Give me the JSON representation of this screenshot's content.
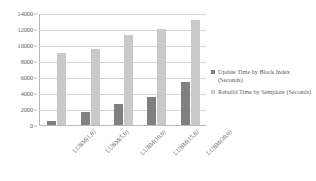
{
  "chart_data": {
    "type": "bar",
    "title": "",
    "xlabel": "",
    "ylabel": "",
    "ylim": [
      0,
      14000
    ],
    "grid": true,
    "legend_position": "right",
    "categories": [
      "LUBM(1,0)",
      "LUBM(5,0)",
      "LUBM(10,0)",
      "LUBM(15,0)",
      "LUBM(20,0)"
    ],
    "y_ticks": [
      14000,
      12000,
      10000,
      8000,
      6000,
      4000,
      2000,
      0
    ],
    "series": [
      {
        "name": "Update Time by Block Index (Seconds)",
        "color": "#808080",
        "values": [
          500,
          1600,
          2600,
          3450,
          5400
        ]
      },
      {
        "name": "Rebuild Time by Semplore (Seconds)",
        "color": "#c9c9c9",
        "values": [
          9000,
          9450,
          11200,
          12050,
          13150
        ]
      }
    ]
  },
  "legend": {
    "items": [
      {
        "label": "Update Time by Block Index (Seconds)"
      },
      {
        "label": "Rebuild Time by Semplore (Seconds)"
      }
    ]
  }
}
